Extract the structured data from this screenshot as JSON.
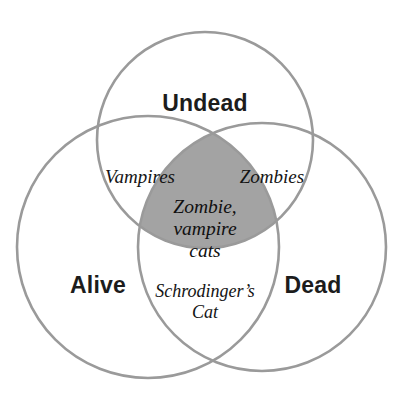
{
  "diagram": {
    "kind": "venn-diagram",
    "set_count": 3,
    "colors": {
      "background": "#ffffff",
      "circle_stroke": "#9a9a9a",
      "triple_intersection_fill": "#a3a3a3",
      "set_label_text": "#1c1c1c",
      "region_label_text": "#141414"
    },
    "sets": [
      {
        "id": "undead",
        "label": "Undead",
        "position": "top",
        "center": {
          "x": 205,
          "y": 140
        },
        "radius": 108
      },
      {
        "id": "alive",
        "label": "Alive",
        "position": "bottom-left",
        "center": {
          "x": 148,
          "y": 247
        },
        "radius": 131
      },
      {
        "id": "dead",
        "label": "Dead",
        "position": "bottom-right",
        "center": {
          "x": 262,
          "y": 247
        },
        "radius": 124
      }
    ],
    "regions": [
      {
        "id": "undead-alive",
        "label": "Vampires",
        "sets": [
          "undead",
          "alive"
        ],
        "lines": [
          "Vampires"
        ],
        "filled": false
      },
      {
        "id": "undead-dead",
        "label": "Zombies",
        "sets": [
          "undead",
          "dead"
        ],
        "lines": [
          "Zombies"
        ],
        "filled": false
      },
      {
        "id": "undead-alive-dead",
        "label": "Zombie, vampire cats",
        "sets": [
          "undead",
          "alive",
          "dead"
        ],
        "lines": [
          "Zombie,",
          "vampire",
          "cats"
        ],
        "filled": true,
        "fill": "#a3a3a3"
      },
      {
        "id": "alive-dead",
        "label": "Schrodinger's Cat",
        "sets": [
          "alive",
          "dead"
        ],
        "lines": [
          "Schrodinger’s",
          "Cat"
        ],
        "filled": false
      }
    ]
  }
}
